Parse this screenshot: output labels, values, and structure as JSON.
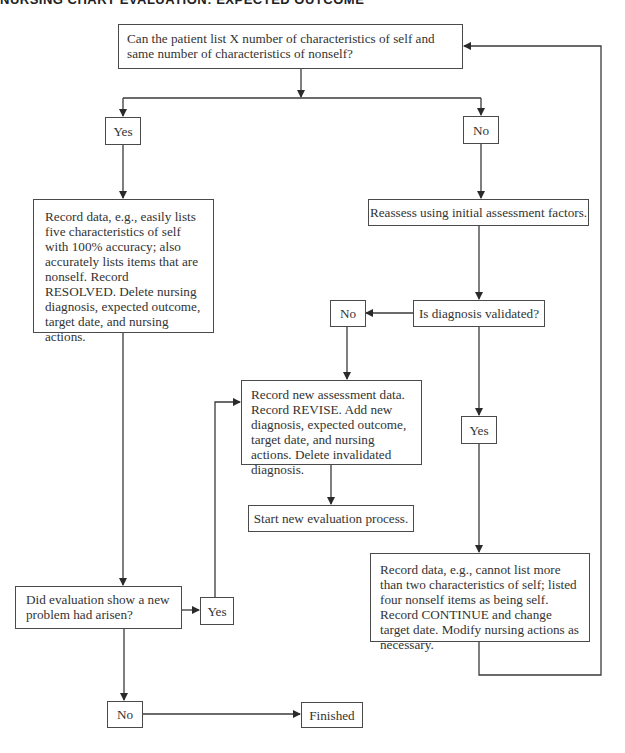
{
  "header": {
    "title": "NURSING CHART EVALUATION: EXPECTED OUTCOME"
  },
  "flowchart": {
    "start_question": "Can the patient list X number of characteristics of self and same number of characteristics of nonself?",
    "branch_yes": "Yes",
    "branch_no": "No",
    "resolved_box": "Record data, e.g., easily lists five characteristics of self with 100% accuracy; also accurately lists items that are nonself. Record RESOLVED. Delete nursing diagnosis, expected outcome, target date, and nursing actions.",
    "reassess_box": "Reassess using initial assessment factors.",
    "validated_question": "Is diagnosis validated?",
    "validated_no": "No",
    "validated_yes": "Yes",
    "revise_box": "Record new assessment data. Record REVISE. Add new diagnosis, expected outcome, target date, and nursing actions. Delete invalidated diagnosis.",
    "start_new_box": "Start new evaluation process.",
    "continue_box": "Record data, e.g., cannot list more than two characteristics of self; listed four nonself items as being self. Record CONTINUE and change target date. Modify nursing actions as necessary.",
    "new_problem_question": "Did evaluation show a new problem had arisen?",
    "new_problem_yes": "Yes",
    "new_problem_no": "No",
    "finished": "Finished"
  },
  "colors": {
    "line": "#3a3a3a",
    "text": "#333333",
    "background": "#ffffff"
  }
}
